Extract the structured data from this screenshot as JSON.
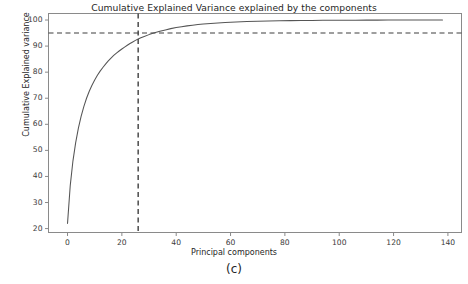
{
  "figure": {
    "caption": "(c)",
    "background_color": "#ffffff",
    "width": 468,
    "height": 284
  },
  "chart_data": {
    "type": "line",
    "title": "Cumulative Explained Variance explained by the components",
    "xlabel": "Principal components",
    "ylabel": "Cumulative Explained variance",
    "grid": false,
    "legend": null,
    "line_color": "#555555",
    "xlim": [
      -7,
      145
    ],
    "ylim": [
      18.5,
      102.5
    ],
    "xticks": [
      0,
      20,
      40,
      60,
      80,
      100,
      120,
      140
    ],
    "xtick_labels": [
      "0",
      "20",
      "40",
      "60",
      "80",
      "100",
      "120",
      "140"
    ],
    "yticks": [
      20,
      30,
      40,
      50,
      60,
      70,
      80,
      90,
      100
    ],
    "ytick_labels": [
      "20",
      "30",
      "40",
      "50",
      "60",
      "70",
      "80",
      "90",
      "100"
    ],
    "annotations": [
      {
        "name": "variance-threshold-line",
        "orientation": "horizontal",
        "value": 95,
        "style": "dashed",
        "color": "#3f3f3f"
      },
      {
        "name": "n-components-line",
        "orientation": "vertical",
        "value": 26,
        "style": "dashed",
        "color": "#3f3f3f"
      }
    ],
    "x": [
      0,
      1,
      2,
      3,
      4,
      5,
      6,
      7,
      8,
      9,
      10,
      11,
      12,
      13,
      14,
      15,
      16,
      17,
      18,
      19,
      20,
      21,
      22,
      23,
      24,
      25,
      26,
      27,
      28,
      30,
      32,
      34,
      36,
      38,
      40,
      42,
      44,
      46,
      48,
      50,
      54,
      58,
      62,
      66,
      70,
      74,
      78,
      82,
      86,
      90,
      94,
      98,
      102,
      106,
      110,
      114,
      118,
      122,
      126,
      130,
      134,
      138
    ],
    "y": [
      22.0,
      36.5,
      46.0,
      53.0,
      58.5,
      63.0,
      66.8,
      70.0,
      72.7,
      75.0,
      77.0,
      78.8,
      80.4,
      81.8,
      83.1,
      84.3,
      85.4,
      86.4,
      87.3,
      88.1,
      88.9,
      89.6,
      90.3,
      91.0,
      91.6,
      92.2,
      92.7,
      93.2,
      93.6,
      94.4,
      95.1,
      95.7,
      96.2,
      96.7,
      97.1,
      97.45,
      97.75,
      98.0,
      98.25,
      98.45,
      98.8,
      99.05,
      99.25,
      99.4,
      99.52,
      99.62,
      99.7,
      99.76,
      99.81,
      99.85,
      99.88,
      99.9,
      99.92,
      99.94,
      99.955,
      99.965,
      99.975,
      99.982,
      99.988,
      99.993,
      99.997,
      100.0
    ]
  }
}
